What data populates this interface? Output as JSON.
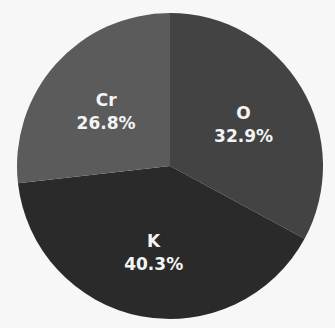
{
  "chart_data": {
    "type": "pie",
    "title": "",
    "categories": [
      "O",
      "K",
      "Cr"
    ],
    "values": [
      32.9,
      40.3,
      26.8
    ],
    "labels": [
      "32.9%",
      "40.3%",
      "26.8%"
    ],
    "colors": [
      "#434343",
      "#2a2a2a",
      "#5b5b5b"
    ],
    "start_angle": "top (12 o'clock)",
    "direction": "clockwise",
    "legend": "none",
    "center": [
      170,
      166
    ],
    "radius": 153
  },
  "background": "#f7f7f7",
  "label_color": "#f4f4f4"
}
